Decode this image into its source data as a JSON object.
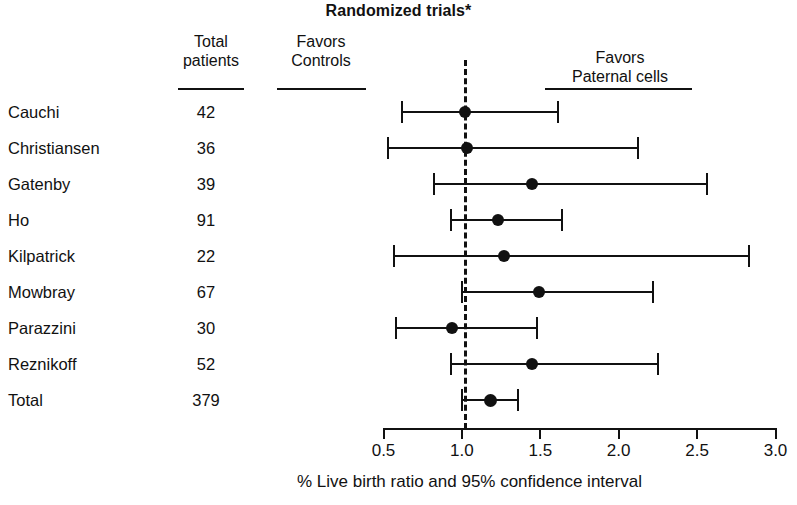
{
  "title": "Randomized trials*",
  "headers": {
    "study_column": "",
    "total_patients": "Total\npatients",
    "favors_controls": "Favors\nControls",
    "favors_paternal": "Favors\nPaternal cells"
  },
  "axis": {
    "caption": "% Live birth ratio and 95% confidence interval",
    "ticks": [
      "0.5",
      "1.0",
      "1.5",
      "2.0",
      "2.5",
      "3.0"
    ],
    "tick_values": [
      0.5,
      1.0,
      1.5,
      2.0,
      2.5,
      3.0
    ],
    "reference_value": 1.0
  },
  "chart_data": {
    "type": "forest",
    "title": "Randomized trials*",
    "xlabel": "% Live birth ratio and 95% confidence interval",
    "ylabel": "",
    "xlim": [
      0.5,
      3.0
    ],
    "xticks": [
      0.5,
      1.0,
      1.5,
      2.0,
      2.5,
      3.0
    ],
    "reference_line": 1.0,
    "grid": false,
    "legend": "none",
    "columns": [
      "Study",
      "Total patients",
      "% Live birth ratio (95% CI)"
    ],
    "rows": [
      {
        "study": "Cauchi",
        "total_patients": "42",
        "estimate": 1.02,
        "ci_low": 0.62,
        "ci_high": 1.61,
        "is_total": false
      },
      {
        "study": "Christiansen",
        "total_patients": "36",
        "estimate": 1.03,
        "ci_low": 0.53,
        "ci_high": 2.12,
        "is_total": false
      },
      {
        "study": "Gatenby",
        "total_patients": "39",
        "estimate": 1.45,
        "ci_low": 0.82,
        "ci_high": 2.56,
        "is_total": false
      },
      {
        "study": "Ho",
        "total_patients": "91",
        "estimate": 1.23,
        "ci_low": 0.93,
        "ci_high": 1.64,
        "is_total": false
      },
      {
        "study": "Kilpatrick",
        "total_patients": "22",
        "estimate": 1.27,
        "ci_low": 0.57,
        "ci_high": 2.83,
        "is_total": false
      },
      {
        "study": "Mowbray",
        "total_patients": "67",
        "estimate": 1.49,
        "ci_low": 1.0,
        "ci_high": 2.22,
        "is_total": false
      },
      {
        "study": "Parazzini",
        "total_patients": "30",
        "estimate": 0.94,
        "ci_low": 0.58,
        "ci_high": 1.48,
        "is_total": false
      },
      {
        "study": "Reznikoff",
        "total_patients": "52",
        "estimate": 1.45,
        "ci_low": 0.93,
        "ci_high": 2.25,
        "is_total": false
      },
      {
        "study": "Total",
        "total_patients": "379",
        "estimate": 1.18,
        "ci_low": 1.0,
        "ci_high": 1.36,
        "is_total": true
      }
    ]
  },
  "colors": {
    "ink": "#111111",
    "background": "#ffffff"
  }
}
